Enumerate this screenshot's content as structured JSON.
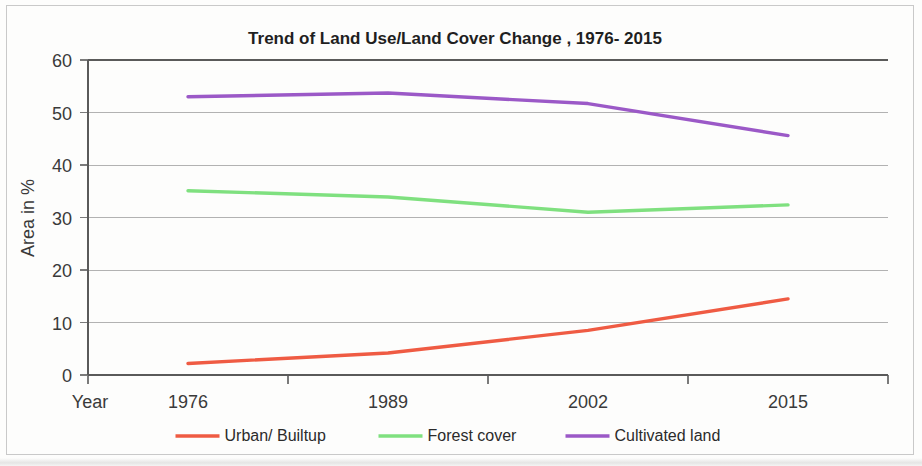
{
  "chart_data": {
    "type": "line",
    "title": "Trend  of Land Use/Land Cover Change , 1976- 2015",
    "xlabel": "Year",
    "ylabel": "Area in %",
    "categories": [
      "1976",
      "1989",
      "2002",
      "2015"
    ],
    "x": [
      1976,
      1989,
      2002,
      2015
    ],
    "series": [
      {
        "name": "Urban/ Builtup",
        "color": "#ef5b43",
        "values": [
          2.2,
          4.2,
          8.5,
          14.5
        ]
      },
      {
        "name": "Forest cover",
        "color": "#7fe07f",
        "values": [
          35.1,
          33.9,
          31.0,
          32.4
        ]
      },
      {
        "name": "Cultivated land",
        "color": "#9b59c7",
        "values": [
          53.0,
          53.7,
          51.7,
          45.6
        ]
      }
    ],
    "ylim": [
      0,
      60
    ],
    "yticks": [
      0,
      10,
      20,
      30,
      40,
      50,
      60
    ],
    "ytick_labels": [
      "0",
      "10",
      "20",
      "30",
      "40",
      "50",
      "60"
    ],
    "xtick_labels": [
      "1976",
      "1989",
      "2002",
      "2015"
    ],
    "grid": "horizontal",
    "legend_position": "bottom"
  },
  "figure": {
    "background_color": "#fdfdfc",
    "frame_color": "#c9c9c9",
    "axis_color": "#5a5a5a",
    "grid_color": "#9a9a9a"
  }
}
